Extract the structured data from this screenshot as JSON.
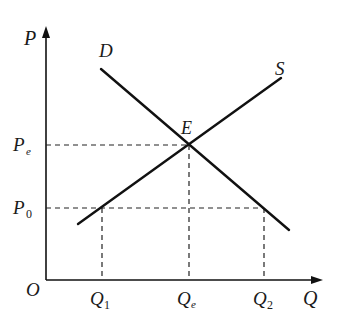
{
  "diagram": {
    "type": "supply-demand",
    "axes": {
      "y_label": "P",
      "x_label": "Q",
      "origin_label": "O"
    },
    "curves": {
      "demand": {
        "label": "D"
      },
      "supply": {
        "label": "S"
      }
    },
    "equilibrium": {
      "label": "E"
    },
    "price_levels": [
      {
        "base": "P",
        "sub": "e"
      },
      {
        "base": "P",
        "sub": "0"
      }
    ],
    "quantity_levels": [
      {
        "base": "Q",
        "sub": "1"
      },
      {
        "base": "Q",
        "sub": "e"
      },
      {
        "base": "Q",
        "sub": "2"
      }
    ]
  },
  "colors": {
    "line": "#111111",
    "dashed": "#222222",
    "background": "#ffffff"
  }
}
